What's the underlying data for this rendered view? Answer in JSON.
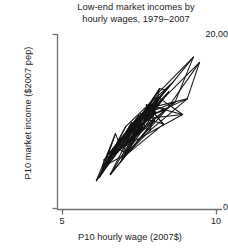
{
  "chart_data": {
    "type": "line",
    "title_lines": [
      "Low-end market incomes by",
      "hourly wages, 1979–2007"
    ],
    "title": "Low-end market incomes by hourly wages, 1979–2007",
    "xlabel": "P10 hourly wage (2007$)",
    "ylabel": "P10 market income ($2007 pep)",
    "xlim": [
      5,
      10
    ],
    "ylim": [
      0,
      20000
    ],
    "xticks": [
      5,
      10
    ],
    "xticklabels": [
      "5",
      "10"
    ],
    "yticks": [
      0,
      20000
    ],
    "yticklabels": [
      "0",
      "20,00"
    ],
    "grid": false,
    "legend": "none",
    "line_color": "#141414",
    "axis_color": "#6b6b6b",
    "series": [
      {
        "name": "P10 market income vs P10 hourly wage, 1979-2007",
        "description": "Connected scatter trajectory of yearly observations; paths criss-cross densely and trend upward to the right.",
        "x": [
          6.1,
          6.72,
          6.28,
          7.05,
          6.4,
          7.38,
          6.55,
          7.7,
          6.2,
          7.25,
          6.85,
          7.95,
          6.35,
          7.48,
          7.02,
          8.1,
          6.62,
          7.3,
          6.95,
          8.35,
          7.15,
          7.82,
          6.48,
          7.6,
          7.9,
          8.58,
          7.35,
          8.05,
          9.25
        ],
        "y": [
          3200,
          8600,
          4200,
          9400,
          5100,
          10200,
          6000,
          11400,
          3600,
          9900,
          7400,
          12100,
          5600,
          10700,
          8200,
          12800,
          6800,
          9100,
          7900,
          13600,
          8800,
          11800,
          6200,
          10400,
          12300,
          14500,
          9600,
          13100,
          17400
        ]
      },
      {
        "name": "secondary overlapping path",
        "description": "Additional crossing segments forming the tangle.",
        "x": [
          6.3,
          7.55,
          6.7,
          7.1,
          7.88,
          6.9,
          8.2,
          7.42,
          6.55,
          7.98,
          7.2,
          8.45,
          6.8,
          7.65,
          8.02,
          7.3,
          8.65,
          7.5,
          6.98,
          8.28,
          7.72,
          8.9,
          7.05,
          8.15,
          7.85,
          9.05,
          7.58,
          8.38,
          9.45
        ],
        "y": [
          4800,
          10900,
          7100,
          6300,
          11600,
          5400,
          12900,
          8900,
          3900,
          10100,
          7700,
          13400,
          6500,
          9300,
          11100,
          8400,
          12200,
          10600,
          5900,
          9700,
          11900,
          10800,
          7200,
          13800,
          9000,
          12600,
          10300,
          11400,
          16800
        ]
      }
    ]
  },
  "axes": {
    "tick_top_label": "20,00",
    "tick_bottom_label": "0",
    "tick_x_left_label": "5",
    "tick_x_right_label": "10"
  }
}
